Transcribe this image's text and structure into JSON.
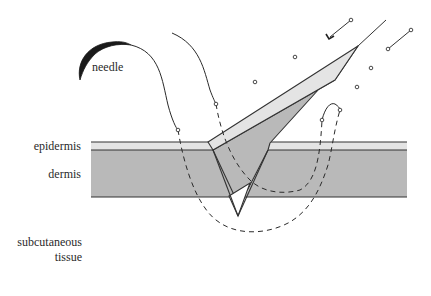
{
  "diagram": {
    "type": "suture-illustration",
    "labels": {
      "needle": "needle",
      "epidermis": "epidermis",
      "dermis": "dermis",
      "subcutaneous_line1": "subcutaneous",
      "subcutaneous_line2": "tissue"
    },
    "colors": {
      "epidermis": "#e4e4e4",
      "dermis": "#b9b9b9",
      "outline": "#333333",
      "needle": "#1a1a1a",
      "thread": "#2a2a2a",
      "background": "#ffffff"
    },
    "layers": [
      {
        "name": "epidermis",
        "label_key": "epidermis"
      },
      {
        "name": "dermis",
        "label_key": "dermis"
      },
      {
        "name": "subcutaneous tissue",
        "label_key": "subcutaneous"
      }
    ]
  }
}
